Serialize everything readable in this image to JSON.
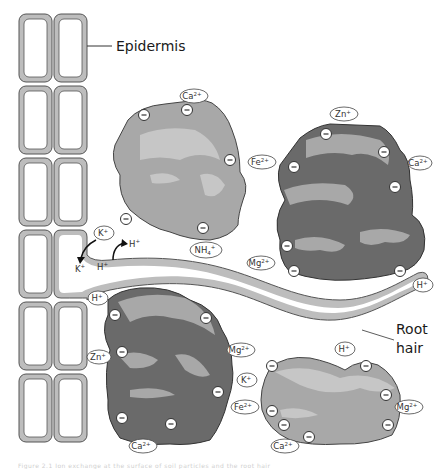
{
  "labels": {
    "epidermis": "Epidermis",
    "root_hair_line1": "Root",
    "root_hair_line2": "hair"
  },
  "exchange": {
    "k_out": "K",
    "k_out_sup": "+",
    "h_in": "H",
    "h_in_sup": "+",
    "h_out": "H",
    "h_out_sup": "+"
  },
  "ions": [
    {
      "id": "ca-top",
      "base": "Ca",
      "sup": "2+",
      "x": 194,
      "y": 96
    },
    {
      "id": "fe-1",
      "base": "Fe",
      "sup": "2+",
      "x": 262,
      "y": 162
    },
    {
      "id": "zn-1",
      "base": "Zn",
      "sup": "+",
      "x": 344,
      "y": 114
    },
    {
      "id": "ca-right",
      "base": "Ca",
      "sup": "2+",
      "x": 420,
      "y": 163
    },
    {
      "id": "k-top",
      "base": "K",
      "sup": "+",
      "x": 104,
      "y": 233
    },
    {
      "id": "nh4",
      "base": "NH",
      "sub": "4",
      "sup": "+",
      "x": 206,
      "y": 250
    },
    {
      "id": "mg-1",
      "base": "Mg",
      "sup": "2+",
      "x": 261,
      "y": 263
    },
    {
      "id": "h-right",
      "base": "H",
      "sup": "+",
      "x": 423,
      "y": 285
    },
    {
      "id": "h-left",
      "base": "H",
      "sup": "+",
      "x": 98,
      "y": 298
    },
    {
      "id": "zn-2",
      "base": "Zn",
      "sup": "+",
      "x": 99,
      "y": 357
    },
    {
      "id": "mg-2",
      "base": "Mg",
      "sup": "2+",
      "x": 241,
      "y": 350
    },
    {
      "id": "h-mid",
      "base": "H",
      "sup": "+",
      "x": 345,
      "y": 349
    },
    {
      "id": "k-2",
      "base": "K",
      "sup": "+",
      "x": 247,
      "y": 380
    },
    {
      "id": "fe-2",
      "base": "Fe",
      "sup": "2+",
      "x": 245,
      "y": 407
    },
    {
      "id": "mg-3",
      "base": "Mg",
      "sup": "2+",
      "x": 409,
      "y": 407
    },
    {
      "id": "ca-bottom-1",
      "base": "Ca",
      "sup": "2+",
      "x": 143,
      "y": 446
    },
    {
      "id": "ca-bottom-2",
      "base": "Ca",
      "sup": "2+",
      "x": 285,
      "y": 446
    }
  ],
  "negative_charge": "−",
  "caption": "Figure 2.1  Ion exchange at the surface of soil particles and the root hair"
}
